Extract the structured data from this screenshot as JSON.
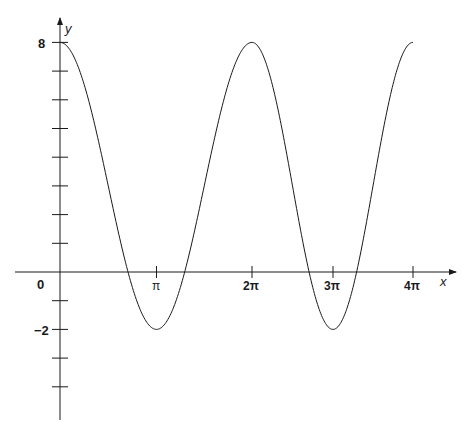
{
  "chart_data": {
    "type": "line",
    "title": "",
    "function": "y = 3 + 5cos(x)",
    "xlabel": "x",
    "ylabel": "y",
    "x_ticks": [
      {
        "label": "0",
        "value": 0
      },
      {
        "label": "π",
        "value": 3.14159
      },
      {
        "label": "2π",
        "value": 6.28319
      },
      {
        "label": "3π",
        "value": 9.42478
      },
      {
        "label": "4π",
        "value": 12.56637
      }
    ],
    "y_ticks_labeled": [
      {
        "label": "8",
        "value": 8
      },
      {
        "label": "−2",
        "value": -2
      }
    ],
    "y_tick_values": [
      8,
      7,
      6,
      5,
      4,
      3,
      2,
      1,
      -1,
      -2,
      -3,
      -4
    ],
    "xlim": [
      0,
      12.56637
    ],
    "ylim": [
      -5.2,
      8.9
    ],
    "grid": false,
    "legend": null,
    "series": [
      {
        "name": "y",
        "x": [
          0,
          1.5708,
          3.14159,
          4.71239,
          6.28319,
          7.85398,
          9.42478,
          10.99557,
          12.56637
        ],
        "values": [
          8,
          3,
          -2,
          3,
          8,
          3,
          -2,
          3,
          8
        ]
      }
    ],
    "key_points": {
      "maxima": [
        [
          0,
          8
        ],
        [
          6.28319,
          8
        ],
        [
          12.56637,
          8
        ]
      ],
      "minima": [
        [
          3.14159,
          -2
        ],
        [
          9.42478,
          -2
        ]
      ]
    }
  },
  "labels": {
    "x_axis": "x",
    "y_axis": "y",
    "origin": "0",
    "y_top": "8",
    "y_bottom": "−2",
    "pi": "π",
    "two_pi": "2π",
    "three_pi": "3π",
    "four_pi": "4π"
  }
}
